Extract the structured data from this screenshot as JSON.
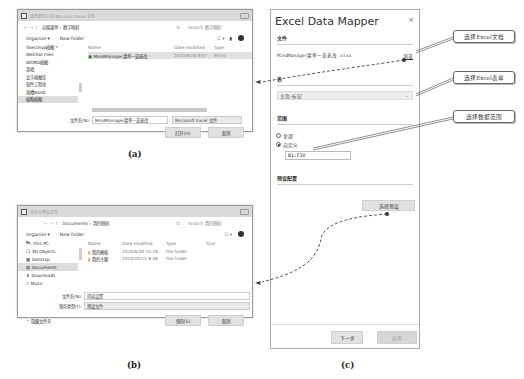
{
  "dialog_a": {
    "title": "选择要导入的 Microsoft Excel 文件",
    "nav_arrows": "← → ↑",
    "path": "功能菜单 › 数字映射",
    "search_placeholder": "Search 数字映射",
    "organize": "Organize ▾",
    "new_folder": "New folder",
    "view_icon": "☷ ▾",
    "nav_items": [
      "SketchUp插图 *",
      "WeChat Files",
      "WORD插图",
      "游戏",
      "会字插图库",
      "软件工程化",
      "拾槽BanD",
      "缩略插图"
    ],
    "selected_nav_index": 7,
    "columns": [
      "Name",
      "Date modified",
      "Type"
    ],
    "files": [
      {
        "name": "MindManager菜单一览表改",
        "date": "2020/6/28 8:07",
        "type": "Micro"
      }
    ],
    "filename_label": "文件名(N):",
    "filename_value": "MindManager菜单一览表改",
    "filetype_value": "Microsoft Excel 文件",
    "open_button": "打开(O)",
    "cancel_button": "取消",
    "caption": "(a)"
  },
  "dialog_b": {
    "title": "另存为预设文件",
    "nav_arrows": "← → ↑",
    "path": "Documents › 我的映射",
    "search_placeholder": "Search 我的映射",
    "organize": "Organize ▾",
    "new_folder": "New folder",
    "view_icon": "☷ ▾",
    "nav_items": [
      "This PC",
      "3D Objects",
      "Desktop",
      "Documents",
      "Downloads",
      "Music"
    ],
    "nav_icons": [
      "computer-icon",
      "cube-icon",
      "desktop-icon",
      "documents-icon",
      "downloads-icon",
      "music-icon"
    ],
    "nav_glyphs": [
      "🖳",
      "❒",
      "▦",
      "▤",
      "⬇",
      "♪"
    ],
    "selected_nav_index": 3,
    "columns": [
      "Name",
      "Date modified",
      "Type",
      "Size"
    ],
    "files": [
      {
        "name": "我的模板",
        "date": "2020/6/30 15:28",
        "type": "File folder",
        "size": ""
      },
      {
        "name": "我的主题",
        "date": "2020/10/15 8:48",
        "type": "File folder",
        "size": ""
      }
    ],
    "filename_label": "文件名(N):",
    "filename_value": "简易设置",
    "savetype_label": "保存类型(T):",
    "savetype_value": "预设文件",
    "hide_folders": "⌃ 隐藏文件夹",
    "save_button": "保存(S)",
    "cancel_button": "取消",
    "caption": "(b)"
  },
  "panel_c": {
    "title": "Excel Data Mapper",
    "close": "×",
    "file_section": "文件",
    "file_name": "MindManager菜单一览表改.xlsx",
    "browse_link": "浏览",
    "sheet_section": "表",
    "sheet_value": "主页-标记",
    "range_section": "范围",
    "radio_all": "全部",
    "radio_custom": "自定义",
    "range_value": "B1:F30",
    "preset_section": "预设配置",
    "choose_preset": "选择预设",
    "next_button": "下一步",
    "apply_button": "应用",
    "caption": "(c)"
  },
  "callouts": [
    "选择Excel文档",
    "选择Excel表单",
    "选择数据范围"
  ]
}
